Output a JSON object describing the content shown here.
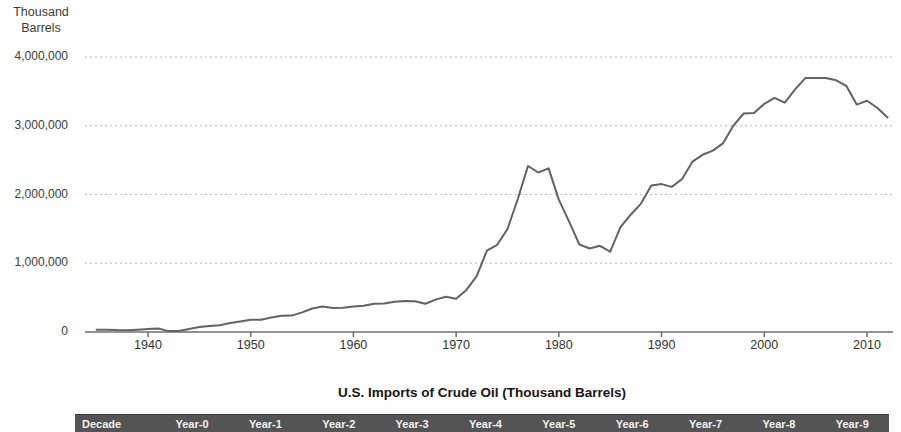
{
  "chart_data": {
    "type": "line",
    "title": "U.S. Imports of Crude Oil (Thousand Barrels)",
    "xlabel": "",
    "ylabel": "Thousand Barrels",
    "ylabel_lines": [
      "Thousand",
      "Barrels"
    ],
    "xlim": [
      1934,
      2013
    ],
    "ylim": [
      0,
      4000000
    ],
    "grid": "horizontal-dotted",
    "legend": "none",
    "line_color": "#636363",
    "xticks": [
      1940,
      1950,
      1960,
      1970,
      1980,
      1990,
      2000,
      2010
    ],
    "xtick_labels": [
      "1940",
      "1950",
      "1960",
      "1970",
      "1980",
      "1990",
      "2000",
      "2010"
    ],
    "yticks": [
      0,
      1000000,
      2000000,
      3000000,
      4000000
    ],
    "ytick_labels": [
      "0",
      "1,000,000",
      "2,000,000",
      "3,000,000",
      "4,000,000"
    ],
    "years": [
      1935,
      1936,
      1937,
      1938,
      1939,
      1940,
      1941,
      1942,
      1943,
      1944,
      1945,
      1946,
      1947,
      1948,
      1949,
      1950,
      1951,
      1952,
      1953,
      1954,
      1955,
      1956,
      1957,
      1958,
      1959,
      1960,
      1961,
      1962,
      1963,
      1964,
      1965,
      1966,
      1967,
      1968,
      1969,
      1970,
      1971,
      1972,
      1973,
      1974,
      1975,
      1976,
      1977,
      1978,
      1979,
      1980,
      1981,
      1982,
      1983,
      1984,
      1985,
      1986,
      1987,
      1988,
      1989,
      1990,
      1991,
      1992,
      1993,
      1994,
      1995,
      1996,
      1997,
      1998,
      1999,
      2000,
      2001,
      2002,
      2003,
      2004,
      2005,
      2006,
      2007,
      2008,
      2009,
      2010,
      2011,
      2012
    ],
    "values": [
      32000,
      33000,
      27000,
      26000,
      33000,
      43000,
      51000,
      13000,
      14000,
      45000,
      74000,
      86000,
      97000,
      129000,
      154000,
      178000,
      179000,
      210000,
      236000,
      239000,
      285000,
      342000,
      373000,
      348000,
      352000,
      372000,
      381000,
      411000,
      413000,
      439000,
      452000,
      447000,
      412000,
      472000,
      514000,
      483000,
      613000,
      811000,
      1184000,
      1269000,
      1498000,
      1935000,
      2414000,
      2320000,
      2380000,
      1926000,
      1605000,
      1273000,
      1215000,
      1254000,
      1168000,
      1525000,
      1706000,
      1868000,
      2133000,
      2151000,
      2110000,
      2226000,
      2477000,
      2578000,
      2639000,
      2748000,
      3002000,
      3178000,
      3187000,
      3320000,
      3405000,
      3336000,
      3528000,
      3693000,
      3696000,
      3693000,
      3661000,
      3580000,
      3307000,
      3363000,
      3261000,
      3121000
    ]
  },
  "table": {
    "title": "U.S. Imports of Crude Oil (Thousand Barrels)",
    "columns": [
      "Decade",
      "Year-0",
      "Year-1",
      "Year-2",
      "Year-3",
      "Year-4",
      "Year-5",
      "Year-6",
      "Year-7",
      "Year-8",
      "Year-9"
    ],
    "header_bg": "#545454",
    "header_text_color": "#f2f2f2"
  }
}
